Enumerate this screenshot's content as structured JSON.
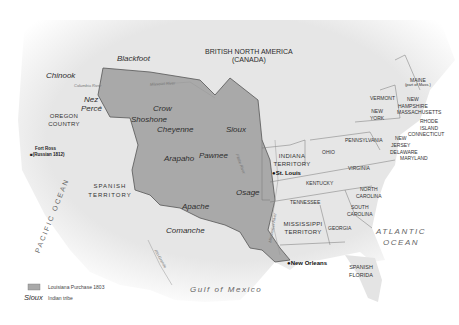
{
  "map": {
    "title": "Louisiana Purchase 1803",
    "colors": {
      "land": "#e8e8e8",
      "purchase": "#a9a9a9",
      "border": "#555555",
      "ocean": "#ffffff",
      "water_label": "#666666"
    },
    "regions": {
      "british": "BRITISH NORTH AMERICA",
      "british_sub": "(CANADA)",
      "oregon": "OREGON\nCOUNTRY",
      "spanish_territory": "SPANISH\nTERRITORY",
      "indiana": "INDIANA\nTERRITORY",
      "mississippi": "MISSISSIPPI\nTERRITORY",
      "spanish_florida": "SPANISH\nFLORIDA"
    },
    "states": {
      "maine": "MAINE",
      "maine_sub": "(part of Mass.)",
      "vermont": "VERMONT",
      "new_hampshire": "NEW\nHAMPSHIRE",
      "massachusetts": "MASSACHUSETTS",
      "new_york": "NEW\nYORK",
      "rhode_island": "RHODE\nISLAND",
      "connecticut": "CONNECTICUT",
      "pennsylvania": "PENNSYLVANIA",
      "new_jersey": "NEW\nJERSEY",
      "delaware": "DELAWARE",
      "maryland": "MARYLAND",
      "ohio": "OHIO",
      "virginia": "VIRGINIA",
      "kentucky": "KENTUCKY",
      "north_carolina": "NORTH\nCAROLINA",
      "tennessee": "TENNESSEE",
      "south_carolina": "SOUTH\nCAROLINA",
      "georgia": "GEORGIA"
    },
    "tribes": [
      "Blackfoot",
      "Chinook",
      "Nez Percé",
      "Crow",
      "Shoshone",
      "Cheyenne",
      "Sioux",
      "Arapaho",
      "Pawnee",
      "Osage",
      "Apache",
      "Comanche"
    ],
    "tribe_labels": {
      "blackfoot": "Blackfoot",
      "chinook": "Chinook",
      "nez": "Nez",
      "perce": "Percé",
      "crow": "Crow",
      "shoshone": "Shoshone",
      "cheyenne": "Cheyenne",
      "sioux": "Sioux",
      "arapaho": "Arapaho",
      "pawnee": "Pawnee",
      "osage": "Osage",
      "apache": "Apache",
      "comanche": "Comanche"
    },
    "cities": {
      "st_louis": "St. Louis",
      "new_orleans": "New Orleans",
      "fort_ross": "Fort Ross",
      "fort_ross_sub": "(Russian 1812)"
    },
    "rivers": {
      "columbia": "Columbia River",
      "missouri": "Missouri River",
      "platte": "Platte River",
      "mississippi": "Mississippi River",
      "rio_grande": "Rio Grande"
    },
    "water": {
      "pacific": "PACIFIC OCEAN",
      "atlantic": "ATLANTIC",
      "atlantic2": "OCEAN",
      "gulf": "Gulf of Mexico"
    },
    "legend": {
      "purchase_label": "Louisiana Purchase 1803",
      "tribe_sample": "Sioux",
      "tribe_label": "Indian tribe"
    }
  }
}
